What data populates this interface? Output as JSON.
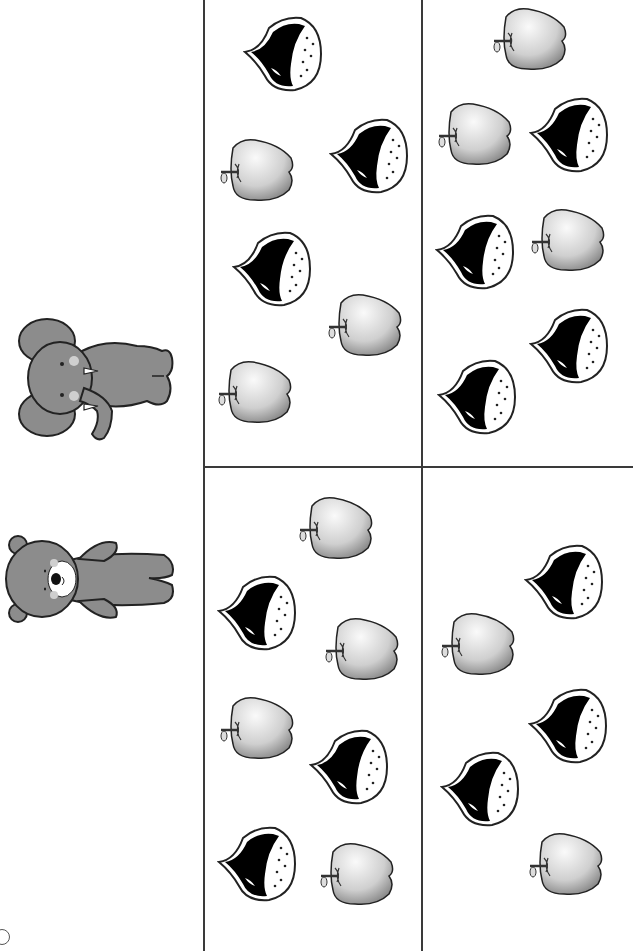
{
  "worksheet": {
    "type": "counting-matching",
    "colors": {
      "line": "#3a3a3a",
      "animal_fill": "#8c8c8c",
      "outline": "#222222",
      "black_apple": "#000000",
      "white_apple_light": "#fafafa",
      "white_apple_dark": "#6e6e6e"
    },
    "grid": {
      "vertical_lines_x": [
        203,
        421
      ],
      "horizontal_line_y": 466
    },
    "rows": [
      {
        "animal": "elephant",
        "animal_label": "elephant",
        "panels": [
          {
            "name": "top-middle-panel",
            "items": [
              {
                "kind": "black-apple",
                "x": 243,
                "y": 14
              },
              {
                "kind": "white-apple",
                "x": 219,
                "y": 136
              },
              {
                "kind": "black-apple",
                "x": 329,
                "y": 116
              },
              {
                "kind": "black-apple",
                "x": 232,
                "y": 229
              },
              {
                "kind": "white-apple",
                "x": 327,
                "y": 291
              },
              {
                "kind": "white-apple",
                "x": 217,
                "y": 358
              }
            ],
            "counts": {
              "black": 3,
              "white": 3
            }
          },
          {
            "name": "top-right-panel",
            "items": [
              {
                "kind": "white-apple",
                "x": 492,
                "y": 5
              },
              {
                "kind": "white-apple",
                "x": 437,
                "y": 100
              },
              {
                "kind": "black-apple",
                "x": 529,
                "y": 95
              },
              {
                "kind": "black-apple",
                "x": 435,
                "y": 212
              },
              {
                "kind": "white-apple",
                "x": 530,
                "y": 206
              },
              {
                "kind": "black-apple",
                "x": 529,
                "y": 306
              },
              {
                "kind": "black-apple",
                "x": 437,
                "y": 357
              }
            ],
            "counts": {
              "black": 4,
              "white": 3
            }
          }
        ]
      },
      {
        "animal": "bear",
        "animal_label": "bear",
        "panels": [
          {
            "name": "bottom-middle-panel",
            "items": [
              {
                "kind": "white-apple",
                "x": 298,
                "y": 494
              },
              {
                "kind": "black-apple",
                "x": 217,
                "y": 573
              },
              {
                "kind": "white-apple",
                "x": 324,
                "y": 615
              },
              {
                "kind": "white-apple",
                "x": 219,
                "y": 694
              },
              {
                "kind": "black-apple",
                "x": 309,
                "y": 727
              },
              {
                "kind": "black-apple",
                "x": 217,
                "y": 824
              },
              {
                "kind": "white-apple",
                "x": 319,
                "y": 840
              }
            ],
            "counts": {
              "black": 3,
              "white": 4
            }
          },
          {
            "name": "bottom-right-panel",
            "items": [
              {
                "kind": "black-apple",
                "x": 524,
                "y": 542
              },
              {
                "kind": "white-apple",
                "x": 440,
                "y": 610
              },
              {
                "kind": "black-apple",
                "x": 528,
                "y": 686
              },
              {
                "kind": "black-apple",
                "x": 440,
                "y": 749
              },
              {
                "kind": "white-apple",
                "x": 528,
                "y": 830
              }
            ],
            "counts": {
              "black": 3,
              "white": 2
            }
          }
        ]
      }
    ]
  }
}
